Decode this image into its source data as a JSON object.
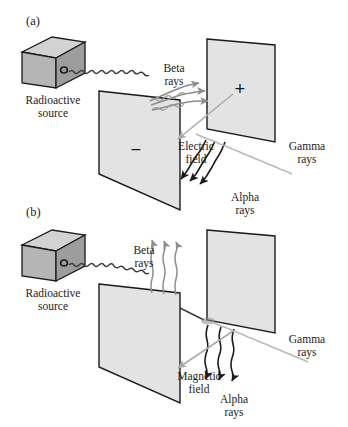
{
  "figure": {
    "background_color": "#ffffff",
    "ink_color": "#1b1b1b"
  },
  "colors": {
    "outline": "#1b1b1b",
    "plate_fill": "#e3e3e3",
    "cube_top": "#d2d2d2",
    "cube_front": "#b5b5b5",
    "cube_side": "#9d9d9d",
    "alpha_ray": "#1b1b1b",
    "beta_ray": "#8d8d8d",
    "gamma_ray": "#b9b9b9",
    "field_arrow": "#aaaaaa",
    "emission_ray": "#3a3a3a"
  },
  "panels": [
    {
      "id": "panel-a",
      "label": "(a)",
      "field_label_line1": "Electric",
      "field_label_line2": "field",
      "field_type": "electric",
      "source": {
        "label_line1": "Radioactive",
        "label_line2": "source",
        "aperture": "pinhole"
      },
      "plates": [
        {
          "id": "front-plate",
          "charge_sign": "−",
          "charge_name": "negative"
        },
        {
          "id": "back-plate",
          "charge_sign": "+",
          "charge_name": "positive"
        }
      ],
      "rays": [
        {
          "id": "beta",
          "label_line1": "Beta",
          "label_line2": "rays",
          "color": "#8d8d8d",
          "deflection": "up-right toward positive plate",
          "count": 3
        },
        {
          "id": "alpha",
          "label_line1": "Alpha",
          "label_line2": "rays",
          "color": "#1b1b1b",
          "deflection": "down-left toward negative plate",
          "count": 3
        },
        {
          "id": "gamma",
          "label_line1": "Gamma",
          "label_line2": "rays",
          "color": "#b9b9b9",
          "deflection": "undeflected, straight",
          "count": 1
        }
      ]
    },
    {
      "id": "panel-b",
      "label": "(b)",
      "field_label_line1": "Magnetic",
      "field_label_line2": "field",
      "field_type": "magnetic",
      "source": {
        "label_line1": "Radioactive",
        "label_line2": "source",
        "aperture": "pinhole"
      },
      "plates": [
        {
          "id": "front-plate",
          "charge_sign": "",
          "charge_name": "none"
        },
        {
          "id": "back-plate",
          "charge_sign": "",
          "charge_name": "none"
        }
      ],
      "rays": [
        {
          "id": "beta",
          "label_line1": "Beta",
          "label_line2": "rays",
          "color": "#8d8d8d",
          "deflection": "deflected straight up",
          "count": 3
        },
        {
          "id": "alpha",
          "label_line1": "Alpha",
          "label_line2": "rays",
          "color": "#1b1b1b",
          "deflection": "deflected straight down",
          "count": 3
        },
        {
          "id": "gamma",
          "label_line1": "Gamma",
          "label_line2": "rays",
          "color": "#b9b9b9",
          "deflection": "undeflected, straight",
          "count": 1
        }
      ]
    }
  ]
}
